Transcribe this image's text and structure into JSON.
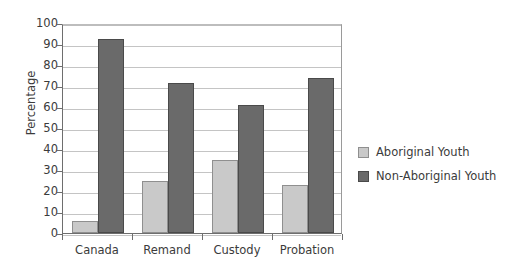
{
  "chart_data": {
    "type": "bar",
    "title": "",
    "xlabel": "",
    "ylabel": "Percentage",
    "ylim": [
      0,
      100
    ],
    "ytick_step": 10,
    "yticks": [
      "0",
      "10",
      "20",
      "30",
      "40",
      "50",
      "60",
      "70",
      "80",
      "90",
      "100"
    ],
    "grid": true,
    "legend_position": "right",
    "categories": [
      "Canada",
      "Remand",
      "Custody",
      "Probation"
    ],
    "series": [
      {
        "name": "Aboriginal Youth",
        "color": "#c9c9c9",
        "values": [
          5.5,
          25,
          35,
          23
        ]
      },
      {
        "name": "Non-Aboriginal Youth",
        "color": "#6a6a6a",
        "values": [
          92.5,
          71.5,
          61,
          74
        ]
      }
    ]
  },
  "colors": {
    "background": "#ffffff",
    "axis": "#6e6e6e",
    "gridline": "#c4c4c4",
    "text": "#3b3b3b",
    "series_light": "#c9c9c9",
    "series_light_border": "#8f8f8f",
    "series_dark": "#6a6a6a",
    "series_dark_border": "#4a4a4a"
  }
}
